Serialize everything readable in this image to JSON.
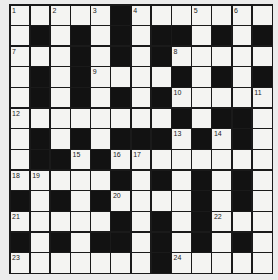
{
  "puzzle": {
    "type": "crossword",
    "rows": 13,
    "cols": 13,
    "colors": {
      "black_cell": "#121212",
      "white_cell": "#f4f4f2",
      "grid_line": "#1a1a1a",
      "background": "#ececec"
    },
    "grid": [
      "WWWWWBWWWWWWW",
      "WBWBWBWBBWBWB",
      "WWWBWBWBWWWWW",
      "WBWBWWWWBWBWB",
      "WBWBWBWBWWWWW",
      "WWWWWWWWBWBBW",
      "WBWBWBBBWBWBW",
      "WBBWBWWWWWWWW",
      "WWWWWBWBWBWBW",
      "BWBWBWWWWBWBW",
      "WWWWWBWBWBWWW",
      "BWBWBBWBWBWBW",
      "WWWWWWWBWWWWW"
    ],
    "numbers": [
      {
        "row": 0,
        "col": 0,
        "n": "1"
      },
      {
        "row": 0,
        "col": 2,
        "n": "2"
      },
      {
        "row": 0,
        "col": 4,
        "n": "3"
      },
      {
        "row": 0,
        "col": 6,
        "n": "4"
      },
      {
        "row": 0,
        "col": 9,
        "n": "5"
      },
      {
        "row": 0,
        "col": 11,
        "n": "6"
      },
      {
        "row": 2,
        "col": 0,
        "n": "7"
      },
      {
        "row": 2,
        "col": 8,
        "n": "8"
      },
      {
        "row": 3,
        "col": 4,
        "n": "9"
      },
      {
        "row": 4,
        "col": 8,
        "n": "10"
      },
      {
        "row": 4,
        "col": 12,
        "n": "11"
      },
      {
        "row": 5,
        "col": 0,
        "n": "12"
      },
      {
        "row": 6,
        "col": 8,
        "n": "13"
      },
      {
        "row": 6,
        "col": 10,
        "n": "14"
      },
      {
        "row": 7,
        "col": 3,
        "n": "15"
      },
      {
        "row": 7,
        "col": 5,
        "n": "16"
      },
      {
        "row": 7,
        "col": 6,
        "n": "17"
      },
      {
        "row": 8,
        "col": 0,
        "n": "18"
      },
      {
        "row": 8,
        "col": 1,
        "n": "19"
      },
      {
        "row": 9,
        "col": 5,
        "n": "20"
      },
      {
        "row": 10,
        "col": 0,
        "n": "21"
      },
      {
        "row": 10,
        "col": 10,
        "n": "22"
      },
      {
        "row": 12,
        "col": 0,
        "n": "23"
      },
      {
        "row": 12,
        "col": 8,
        "n": "24"
      }
    ]
  }
}
